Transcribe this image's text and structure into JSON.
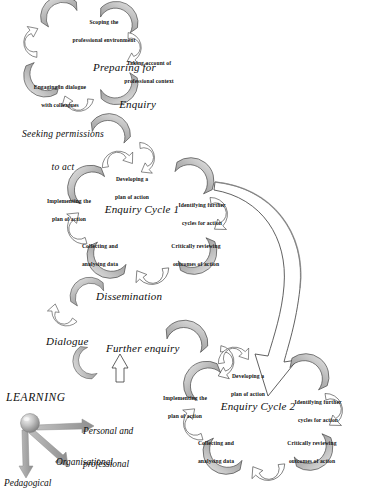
{
  "diagram": {
    "palette": {
      "band_fill": "#b9b9b9",
      "band_fill_light": "#d2d2d2",
      "outline": "#3a3a3a",
      "arrow_fill": "#ffffff",
      "text": "#101010",
      "learning_arrow": "#9a9a9a",
      "sphere_light": "#e8e8e8",
      "sphere_dark": "#8a8a8a"
    }
  },
  "preparing_cycle": {
    "title_line1": "Preparing for",
    "title_line2": "Enquiry",
    "steps": [
      {
        "line1": "Scoping the",
        "line2": "professional environment"
      },
      {
        "line1": "Taking account of",
        "line2": "professional context"
      },
      {
        "line1": "Engaging in dialogue",
        "line2": "with colleagues"
      },
      {
        "line1": "Seeking permissions",
        "line2": "to act"
      }
    ]
  },
  "cycle_one": {
    "title": "Enquiry Cycle 1",
    "steps": [
      {
        "line1": "Developing a",
        "line2": "plan of action"
      },
      {
        "line1": "Identifying further",
        "line2": "cycles for action"
      },
      {
        "line1": "Critically reviewing",
        "line2": "outcomes of action"
      },
      {
        "line1": "Collecting and",
        "line2": "analysing data"
      },
      {
        "line1": "Implementing the",
        "line2": "plan of action"
      }
    ]
  },
  "middle_stage": {
    "dissemination": "Dissemination",
    "dialogue": "Dialogue",
    "further_enquiry": "Further enquiry"
  },
  "cycle_two": {
    "title": "Enquiry Cycle 2",
    "steps": [
      {
        "line1": "Developing a",
        "line2": "plan of action"
      },
      {
        "line1": "Identifying further",
        "line2": "cycles for action"
      },
      {
        "line1": "Critically reviewing",
        "line2": "outcomes of action"
      },
      {
        "line1": "Collecting and",
        "line2": "analysing data"
      },
      {
        "line1": "Implementing the",
        "line2": "plan of action"
      }
    ]
  },
  "learning": {
    "heading": "LEARNING",
    "outcomes": [
      {
        "line1": "Personal and",
        "line2": "professional"
      },
      {
        "line1": "Organisational",
        "line2": ""
      },
      {
        "line1": "Pedagogical",
        "line2": ""
      }
    ]
  }
}
